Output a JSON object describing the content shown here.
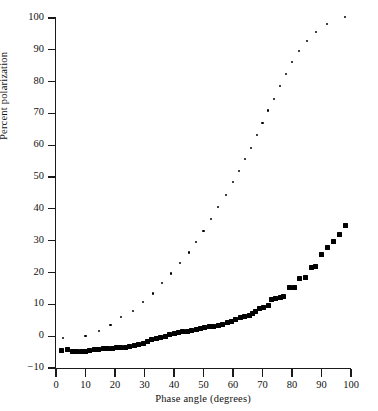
{
  "chart_data": {
    "type": "scatter",
    "title": "",
    "xlabel": "Phase angle (degrees)",
    "ylabel": "Percent polarization",
    "xlim": [
      0,
      100
    ],
    "ylim": [
      -10,
      100
    ],
    "xticks": [
      0,
      10,
      20,
      30,
      40,
      50,
      60,
      70,
      80,
      90,
      100
    ],
    "yticks": [
      -10,
      0,
      10,
      20,
      30,
      40,
      50,
      60,
      70,
      80,
      90,
      100
    ],
    "ytick_labels": [
      "−10",
      "0",
      "10",
      "20",
      "30",
      "40",
      "50",
      "60",
      "70",
      "80",
      "90",
      "100"
    ],
    "grid": false,
    "legend": "none",
    "marker_color": "#000000",
    "axis_color": "#1a1a1a",
    "series": [
      {
        "name": "lower-branch",
        "marker": "square",
        "marker_size": 5.0,
        "points": [
          [
            2.0,
            -4.6
          ],
          [
            4.0,
            -4.2
          ],
          [
            5.5,
            -4.7
          ],
          [
            7.0,
            -4.7
          ],
          [
            8.5,
            -4.8
          ],
          [
            10.0,
            -4.8
          ],
          [
            11.5,
            -4.4
          ],
          [
            13.0,
            -4.2
          ],
          [
            14.5,
            -4.1
          ],
          [
            16.0,
            -4.0
          ],
          [
            17.5,
            -3.9
          ],
          [
            19.0,
            -3.8
          ],
          [
            20.5,
            -3.6
          ],
          [
            22.0,
            -3.5
          ],
          [
            23.5,
            -3.4
          ],
          [
            25.0,
            -3.2
          ],
          [
            26.5,
            -2.9
          ],
          [
            28.0,
            -2.7
          ],
          [
            29.5,
            -2.2
          ],
          [
            31.0,
            -1.6
          ],
          [
            32.5,
            -1.1
          ],
          [
            34.0,
            -0.7
          ],
          [
            35.5,
            -0.4
          ],
          [
            37.0,
            0.0
          ],
          [
            38.5,
            0.4
          ],
          [
            40.0,
            0.8
          ],
          [
            41.5,
            1.1
          ],
          [
            43.0,
            1.4
          ],
          [
            44.5,
            1.6
          ],
          [
            46.0,
            1.8
          ],
          [
            47.5,
            2.2
          ],
          [
            49.0,
            2.5
          ],
          [
            50.5,
            2.8
          ],
          [
            52.0,
            3.0
          ],
          [
            53.5,
            3.2
          ],
          [
            55.0,
            3.4
          ],
          [
            56.5,
            3.7
          ],
          [
            58.0,
            4.2
          ],
          [
            59.5,
            4.7
          ],
          [
            61.0,
            5.3
          ],
          [
            62.5,
            5.8
          ],
          [
            64.0,
            6.2
          ],
          [
            65.5,
            6.6
          ],
          [
            66.5,
            7.2
          ],
          [
            67.5,
            7.9
          ],
          [
            69.0,
            8.6
          ],
          [
            70.5,
            8.9
          ],
          [
            72.0,
            9.7
          ],
          [
            73.0,
            11.6
          ],
          [
            74.5,
            11.9
          ],
          [
            76.0,
            12.2
          ],
          [
            77.0,
            12.4
          ],
          [
            79.0,
            15.3
          ],
          [
            81.0,
            15.2
          ],
          [
            82.5,
            18.0
          ],
          [
            84.5,
            18.5
          ],
          [
            86.5,
            21.7
          ],
          [
            88.0,
            21.8
          ],
          [
            90.0,
            25.6
          ],
          [
            92.0,
            27.8
          ],
          [
            94.0,
            29.9
          ],
          [
            96.0,
            32.0
          ],
          [
            98.0,
            34.8
          ]
        ]
      },
      {
        "name": "upper-branch",
        "marker": "dot",
        "marker_size": 2.2,
        "points": [
          [
            2.5,
            -0.6
          ],
          [
            10.0,
            0.1
          ],
          [
            14.5,
            1.6
          ],
          [
            18.5,
            3.5
          ],
          [
            22.0,
            5.9
          ],
          [
            26.0,
            8.0
          ],
          [
            29.5,
            10.7
          ],
          [
            33.0,
            13.4
          ],
          [
            36.0,
            16.6
          ],
          [
            39.0,
            19.7
          ],
          [
            42.0,
            23.1
          ],
          [
            45.0,
            26.3
          ],
          [
            47.5,
            29.6
          ],
          [
            50.0,
            33.0
          ],
          [
            52.5,
            36.7
          ],
          [
            55.0,
            40.5
          ],
          [
            57.5,
            44.3
          ],
          [
            60.0,
            48.5
          ],
          [
            62.0,
            51.8
          ],
          [
            64.0,
            55.6
          ],
          [
            66.0,
            59.2
          ],
          [
            68.0,
            63.2
          ],
          [
            70.0,
            66.9
          ],
          [
            72.0,
            70.9
          ],
          [
            74.0,
            74.6
          ],
          [
            76.0,
            78.7
          ],
          [
            78.0,
            82.3
          ],
          [
            80.0,
            86.1
          ],
          [
            82.5,
            89.5
          ],
          [
            85.0,
            92.8
          ],
          [
            88.0,
            95.7
          ],
          [
            92.0,
            98.2
          ],
          [
            98.0,
            100.2
          ]
        ]
      }
    ]
  }
}
